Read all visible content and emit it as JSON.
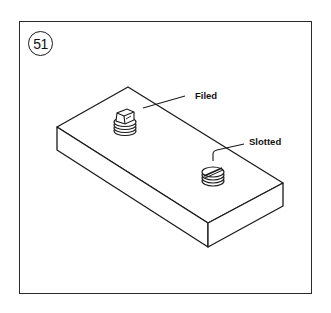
{
  "figure": {
    "number": "51",
    "labels": {
      "filed": "Filed",
      "slotted": "Slotted"
    },
    "colors": {
      "ink": "#1a1a1a",
      "background": "#ffffff"
    },
    "parts": [
      {
        "name": "block",
        "description": "rectangular block in isometric view"
      },
      {
        "name": "filed-screw",
        "label": "Filed"
      },
      {
        "name": "slotted-screw",
        "label": "Slotted"
      }
    ]
  }
}
